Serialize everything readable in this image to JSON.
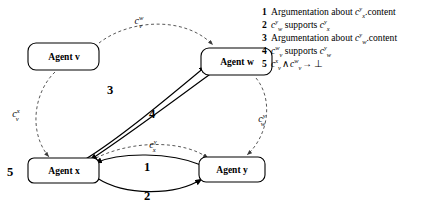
{
  "diagram": {
    "type": "agent-context-graph",
    "nodes": [
      {
        "id": "v",
        "label": "Agent v",
        "x": 68,
        "y": 57
      },
      {
        "id": "w",
        "label": "Agent w",
        "x": 232,
        "y": 62
      },
      {
        "id": "x",
        "label": "Agent x",
        "x": 63,
        "y": 168
      },
      {
        "id": "y",
        "label": "Agent y",
        "x": 228,
        "y": 168
      }
    ],
    "context_labels": [
      {
        "name": "c_v_w",
        "base": "c",
        "sub": "v",
        "sup": "w",
        "x": 139,
        "y": 22
      },
      {
        "name": "c_v_x",
        "base": "c",
        "sub": "v",
        "sup": "x",
        "x": 16,
        "y": 117
      },
      {
        "name": "c_x_y",
        "base": "c",
        "sub": "x",
        "sup": "y",
        "x": 153,
        "y": 146
      },
      {
        "name": "c_w_y",
        "base": "c",
        "sub": "w",
        "sup": "y",
        "x": 262,
        "y": 120
      }
    ],
    "edge_numbers": [
      {
        "name": "edge-number-5",
        "value": "5",
        "x": 10,
        "y": 173
      },
      {
        "name": "edge-number-3",
        "value": "3",
        "x": 110,
        "y": 90
      },
      {
        "name": "edge-number-4",
        "value": "4",
        "x": 152,
        "y": 114
      },
      {
        "name": "edge-number-1",
        "value": "1",
        "x": 147,
        "y": 167
      },
      {
        "name": "edge-number-2",
        "value": "2",
        "x": 147,
        "y": 196
      }
    ],
    "dashed_edges": [
      {
        "name": "dashed-edge-v-to-w"
      },
      {
        "name": "dashed-edge-v-to-x"
      },
      {
        "name": "dashed-edge-x-to-y"
      },
      {
        "name": "dashed-edge-w-to-y"
      }
    ],
    "solid_edges": [
      {
        "name": "solid-edge-x-to-w-3"
      },
      {
        "name": "solid-edge-w-to-x-4"
      },
      {
        "name": "solid-edge-y-to-x-1"
      },
      {
        "name": "solid-edge-x-to-y-2"
      }
    ]
  },
  "legend": {
    "items": [
      {
        "num": "1",
        "name": "legend-item-1",
        "parts": [
          {
            "t": "Argumentation about ",
            "style": "plain"
          },
          {
            "t": "c",
            "style": "italic"
          },
          {
            "t": "y",
            "style": "sup"
          },
          {
            "t": "x",
            "style": "sub"
          },
          {
            "t": ".content",
            "style": "plain"
          }
        ],
        "plain": "1 Argumentation about c_x^y.content"
      },
      {
        "num": "2",
        "name": "legend-item-2",
        "parts": [
          {
            "t": "c",
            "style": "italic"
          },
          {
            "t": "y",
            "style": "sup"
          },
          {
            "t": "w",
            "style": "sub"
          },
          {
            "t": " supports ",
            "style": "plain"
          },
          {
            "t": "c",
            "style": "italic"
          },
          {
            "t": "y",
            "style": "sup"
          },
          {
            "t": "x",
            "style": "sub"
          }
        ],
        "plain": "2 c_w^y supports c_x^y"
      },
      {
        "num": "3",
        "name": "legend-item-3",
        "parts": [
          {
            "t": "Argumentation about ",
            "style": "plain"
          },
          {
            "t": "c",
            "style": "italic"
          },
          {
            "t": "y",
            "style": "sup"
          },
          {
            "t": "w",
            "style": "sub"
          },
          {
            "t": ".content",
            "style": "plain"
          }
        ],
        "plain": "3 Argumentation about c_w^y.content"
      },
      {
        "num": "4",
        "name": "legend-item-4",
        "parts": [
          {
            "t": "c",
            "style": "italic"
          },
          {
            "t": "w",
            "style": "sup"
          },
          {
            "t": "v",
            "style": "sub"
          },
          {
            "t": " supports ",
            "style": "plain"
          },
          {
            "t": "c",
            "style": "italic"
          },
          {
            "t": "y",
            "style": "sup"
          },
          {
            "t": "w",
            "style": "sub"
          }
        ],
        "plain": "4 c_v^w supports c_w^y"
      },
      {
        "num": "5",
        "name": "legend-item-5",
        "parts": [
          {
            "t": "c",
            "style": "italic"
          },
          {
            "t": "x",
            "style": "sup"
          },
          {
            "t": "v",
            "style": "sub"
          },
          {
            "t": "∧",
            "style": "op"
          },
          {
            "t": "c",
            "style": "italic"
          },
          {
            "t": "w",
            "style": "sup"
          },
          {
            "t": "v",
            "style": "sub"
          },
          {
            "t": "→",
            "style": "op"
          },
          {
            "t": "⊥",
            "style": "op"
          }
        ],
        "plain": "5 c_v^x ∧ c_v^w → ⊥"
      }
    ]
  },
  "colors": {
    "background": "#ffffff",
    "stroke": "#000000",
    "dashed_stroke": "#3a3a3a"
  }
}
